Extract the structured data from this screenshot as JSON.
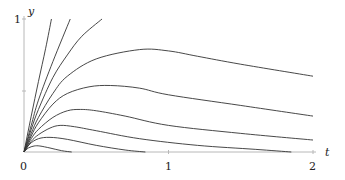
{
  "chart_data": {
    "type": "line",
    "title": "",
    "xlabel": "t",
    "ylabel": "y",
    "xlim": [
      0,
      2
    ],
    "ylim": [
      0,
      1
    ],
    "x_ticks": [
      {
        "value": 0,
        "label": "0"
      },
      {
        "value": 1,
        "label": "1"
      },
      {
        "value": 2,
        "label": "2"
      }
    ],
    "y_ticks": [
      {
        "value": 0.5,
        "label": ""
      },
      {
        "value": 1,
        "label": "1"
      }
    ],
    "grid": false,
    "legend": null,
    "series": [
      {
        "name": "curve-1",
        "points": [
          [
            0,
            0
          ],
          [
            0.05,
            0.27
          ],
          [
            0.1,
            0.53
          ],
          [
            0.15,
            0.78
          ],
          [
            0.19,
            1.0
          ]
        ]
      },
      {
        "name": "curve-2",
        "points": [
          [
            0,
            0
          ],
          [
            0.05,
            0.2
          ],
          [
            0.1,
            0.39
          ],
          [
            0.2,
            0.68
          ],
          [
            0.32,
            1.0
          ]
        ]
      },
      {
        "name": "curve-3",
        "points": [
          [
            0,
            0
          ],
          [
            0.05,
            0.17
          ],
          [
            0.1,
            0.32
          ],
          [
            0.2,
            0.56
          ],
          [
            0.3,
            0.73
          ],
          [
            0.4,
            0.87
          ],
          [
            0.54,
            1.0
          ]
        ]
      },
      {
        "name": "curve-4",
        "points": [
          [
            0,
            0
          ],
          [
            0.05,
            0.14
          ],
          [
            0.1,
            0.26
          ],
          [
            0.2,
            0.44
          ],
          [
            0.3,
            0.57
          ],
          [
            0.5,
            0.7
          ],
          [
            0.8,
            0.77
          ],
          [
            1.0,
            0.76
          ],
          [
            1.2,
            0.72
          ],
          [
            1.5,
            0.66
          ],
          [
            2.0,
            0.57
          ]
        ]
      },
      {
        "name": "curve-5",
        "points": [
          [
            0,
            0
          ],
          [
            0.05,
            0.12
          ],
          [
            0.1,
            0.22
          ],
          [
            0.2,
            0.36
          ],
          [
            0.3,
            0.44
          ],
          [
            0.45,
            0.49
          ],
          [
            0.6,
            0.5
          ],
          [
            0.8,
            0.48
          ],
          [
            1.0,
            0.43
          ],
          [
            1.5,
            0.35
          ],
          [
            2.0,
            0.27
          ]
        ]
      },
      {
        "name": "curve-6",
        "points": [
          [
            0,
            0
          ],
          [
            0.05,
            0.1
          ],
          [
            0.1,
            0.17
          ],
          [
            0.2,
            0.26
          ],
          [
            0.3,
            0.31
          ],
          [
            0.39,
            0.32
          ],
          [
            0.5,
            0.31
          ],
          [
            0.7,
            0.27
          ],
          [
            1.0,
            0.2
          ],
          [
            1.5,
            0.14
          ],
          [
            2.0,
            0.09
          ]
        ]
      },
      {
        "name": "curve-7",
        "points": [
          [
            0,
            0
          ],
          [
            0.05,
            0.08
          ],
          [
            0.1,
            0.13
          ],
          [
            0.18,
            0.18
          ],
          [
            0.25,
            0.2
          ],
          [
            0.35,
            0.19
          ],
          [
            0.5,
            0.16
          ],
          [
            0.8,
            0.1
          ],
          [
            1.2,
            0.05
          ],
          [
            1.6,
            0.02
          ],
          [
            1.85,
            0.0
          ]
        ]
      },
      {
        "name": "curve-8",
        "points": [
          [
            0,
            0
          ],
          [
            0.04,
            0.06
          ],
          [
            0.1,
            0.1
          ],
          [
            0.18,
            0.11
          ],
          [
            0.3,
            0.095
          ],
          [
            0.5,
            0.05
          ],
          [
            0.7,
            0.015
          ],
          [
            0.84,
            0.0
          ]
        ]
      },
      {
        "name": "curve-9",
        "points": [
          [
            0,
            0
          ],
          [
            0.03,
            0.03
          ],
          [
            0.07,
            0.045
          ],
          [
            0.11,
            0.045
          ],
          [
            0.18,
            0.03
          ],
          [
            0.26,
            0.01
          ],
          [
            0.33,
            0.0
          ]
        ]
      }
    ]
  },
  "labels": {
    "x_axis": "t",
    "y_axis": "y",
    "x0": "0",
    "x1": "1",
    "x2": "2",
    "y1": "1"
  }
}
